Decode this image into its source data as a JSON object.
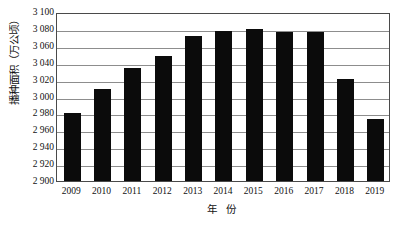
{
  "chart_data": {
    "type": "bar",
    "title": "",
    "xlabel": "年 份",
    "ylabel": "播种面积（万公顷）",
    "categories": [
      "2009",
      "2010",
      "2011",
      "2012",
      "2013",
      "2014",
      "2015",
      "2016",
      "2017",
      "2018",
      "2019"
    ],
    "values": [
      2980,
      3009,
      3034,
      3048,
      3072,
      3078,
      3080,
      3076,
      3076,
      3021,
      2973
    ],
    "series": [
      {
        "name": "播种面积",
        "values": [
          2980,
          3009,
          3034,
          3048,
          3072,
          3078,
          3080,
          3076,
          3076,
          3021,
          2973
        ]
      }
    ],
    "ylim": [
      2900,
      3100
    ],
    "ytick_step": 20,
    "ytick_labels": [
      "3 100",
      "3 080",
      "3 060",
      "3 040",
      "3 020",
      "3 000",
      "2 980",
      "2 960",
      "2 940",
      "2 920",
      "2 900"
    ],
    "ytick_values": [
      3100,
      3080,
      3060,
      3040,
      3020,
      3000,
      2980,
      2960,
      2940,
      2920,
      2900
    ],
    "grid": true,
    "legend": "none",
    "bar_color": "#0b0b0b",
    "grid_color": "#8d8d8d",
    "axis_color": "#4a4a4a",
    "background": "#ffffff"
  }
}
